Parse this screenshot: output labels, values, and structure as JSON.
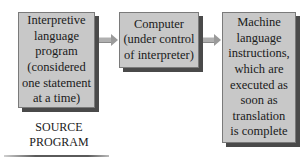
{
  "diagram": {
    "boxes": [
      {
        "id": "source",
        "text": "Interpretive\nlanguage\nprogram\n(considered\none statement\nat a time)"
      },
      {
        "id": "computer",
        "text": "Computer\n(under control\nof interpreter)"
      },
      {
        "id": "output",
        "text": "Machine\nlanguage\ninstructions,\nwhich are\nexecuted as\nsoon as\ntranslation\nis complete"
      }
    ],
    "arrows": [
      {
        "from": "source",
        "to": "computer",
        "icon": "right-arrow-icon"
      },
      {
        "from": "computer",
        "to": "output",
        "icon": "right-arrow-icon"
      }
    ],
    "source_label": "SOURCE\nPROGRAM"
  },
  "colors": {
    "box_fill": "#c8c8c8",
    "box_shadow": "#4a4a4a",
    "arrow": "#a0a0a0",
    "text": "#1a1a1a"
  }
}
